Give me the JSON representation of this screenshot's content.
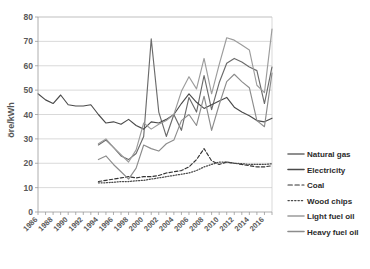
{
  "chart_data": {
    "type": "line",
    "title": "",
    "xlabel": "",
    "ylabel": "öre/kWh",
    "ylim": [
      0,
      80
    ],
    "yticks": [
      0,
      10,
      20,
      30,
      40,
      50,
      60,
      70,
      80
    ],
    "xlim": [
      1986,
      2017
    ],
    "xticks": [
      1986,
      1988,
      1990,
      1992,
      1994,
      1996,
      1998,
      2000,
      2002,
      2004,
      2006,
      2008,
      2010,
      2012,
      2014,
      2016
    ],
    "x": [
      1986,
      1987,
      1988,
      1989,
      1990,
      1991,
      1992,
      1993,
      1994,
      1995,
      1996,
      1997,
      1998,
      1999,
      2000,
      2001,
      2002,
      2003,
      2004,
      2005,
      2006,
      2007,
      2008,
      2009,
      2010,
      2011,
      2012,
      2013,
      2014,
      2015,
      2016,
      2017
    ],
    "grid": true,
    "legend_position": "right",
    "series": [
      {
        "name": "Natural gas",
        "color": "#6b6b6b",
        "style": "solid",
        "x": [
          1994,
          1995,
          1996,
          1997,
          1998,
          1999,
          2000,
          2001,
          2002,
          2003,
          2004,
          2005,
          2006,
          2007,
          2008,
          2009,
          2010,
          2011,
          2012,
          2013,
          2014,
          2015,
          2016,
          2017
        ],
        "values": [
          27.5,
          29.5,
          26.5,
          23.0,
          21.5,
          24.0,
          31.0,
          71.0,
          41.0,
          31.0,
          40.0,
          33.5,
          47.0,
          41.0,
          56.0,
          42.0,
          53.0,
          61.0,
          63.0,
          61.5,
          59.5,
          58.0,
          44.5,
          59.5
        ]
      },
      {
        "name": "Electricity",
        "color": "#4a4a4a",
        "style": "solid",
        "x": [
          1986,
          1987,
          1988,
          1989,
          1990,
          1991,
          1992,
          1993,
          1994,
          1995,
          1996,
          1997,
          1998,
          1999,
          2000,
          2001,
          2002,
          2003,
          2004,
          2005,
          2006,
          2007,
          2008,
          2009,
          2010,
          2011,
          2012,
          2013,
          2014,
          2015,
          2016,
          2017
        ],
        "values": [
          48.5,
          46.0,
          44.5,
          48.0,
          44.0,
          43.5,
          43.5,
          44.0,
          40.0,
          36.5,
          37.0,
          36.0,
          38.0,
          35.5,
          34.0,
          37.0,
          36.5,
          38.0,
          40.0,
          44.5,
          48.5,
          45.0,
          42.5,
          44.0,
          45.5,
          47.0,
          43.0,
          41.0,
          39.5,
          37.5,
          37.0,
          38.5
        ]
      },
      {
        "name": "Coal",
        "color": "#333333",
        "style": "dashed",
        "x": [
          1994,
          1995,
          1996,
          1997,
          1998,
          1999,
          2000,
          2001,
          2002,
          2003,
          2004,
          2005,
          2006,
          2007,
          2008,
          2009,
          2010,
          2011,
          2012,
          2013,
          2014,
          2015,
          2016,
          2017
        ],
        "values": [
          12.5,
          13.0,
          13.5,
          14.0,
          14.5,
          14.0,
          14.5,
          14.5,
          15.0,
          16.0,
          16.5,
          17.0,
          18.5,
          21.5,
          26.0,
          21.0,
          19.5,
          20.5,
          20.0,
          19.5,
          19.0,
          18.5,
          18.5,
          19.0
        ]
      },
      {
        "name": "Wood chips",
        "color": "#4a4a4a",
        "style": "dotted",
        "x": [
          1994,
          1995,
          1996,
          1997,
          1998,
          1999,
          2000,
          2001,
          2002,
          2003,
          2004,
          2005,
          2006,
          2007,
          2008,
          2009,
          2010,
          2011,
          2012,
          2013,
          2014,
          2015,
          2016,
          2017
        ],
        "values": [
          12.0,
          12.0,
          12.2,
          12.5,
          12.5,
          12.8,
          13.0,
          13.5,
          14.0,
          14.5,
          15.0,
          15.5,
          16.0,
          17.0,
          18.5,
          19.5,
          20.5,
          20.5,
          20.0,
          19.8,
          19.5,
          19.5,
          19.5,
          19.8
        ]
      },
      {
        "name": "Light fuel oil",
        "color": "#9c9c9c",
        "style": "solid",
        "x": [
          1994,
          1995,
          1996,
          1997,
          1998,
          1999,
          2000,
          2001,
          2002,
          2003,
          2004,
          2005,
          2006,
          2007,
          2008,
          2009,
          2010,
          2011,
          2012,
          2013,
          2014,
          2015,
          2016,
          2017
        ],
        "values": [
          28.0,
          30.0,
          26.5,
          23.5,
          20.5,
          25.5,
          36.5,
          34.0,
          36.0,
          37.5,
          40.0,
          49.5,
          55.5,
          50.5,
          63.0,
          48.5,
          60.5,
          71.5,
          70.5,
          68.5,
          66.5,
          52.0,
          49.0,
          75.0
        ]
      },
      {
        "name": "Heavy fuel oil",
        "color": "#8c8c8c",
        "style": "solid",
        "x": [
          1994,
          1995,
          1996,
          1997,
          1998,
          1999,
          2000,
          2001,
          2002,
          2003,
          2004,
          2005,
          2006,
          2007,
          2008,
          2009,
          2010,
          2011,
          2012,
          2013,
          2014,
          2015,
          2016,
          2017
        ],
        "values": [
          21.5,
          23.0,
          19.5,
          16.5,
          13.5,
          18.0,
          27.5,
          26.0,
          25.0,
          28.0,
          29.5,
          37.5,
          40.0,
          35.5,
          47.5,
          33.5,
          44.0,
          53.5,
          56.5,
          53.5,
          51.0,
          37.5,
          35.0,
          57.0
        ]
      }
    ]
  },
  "legend": {
    "items": [
      {
        "label": "Natural gas"
      },
      {
        "label": "Electricity"
      },
      {
        "label": "Coal"
      },
      {
        "label": "Wood chips"
      },
      {
        "label": "Light fuel oil"
      },
      {
        "label": "Heavy fuel oil"
      }
    ]
  }
}
